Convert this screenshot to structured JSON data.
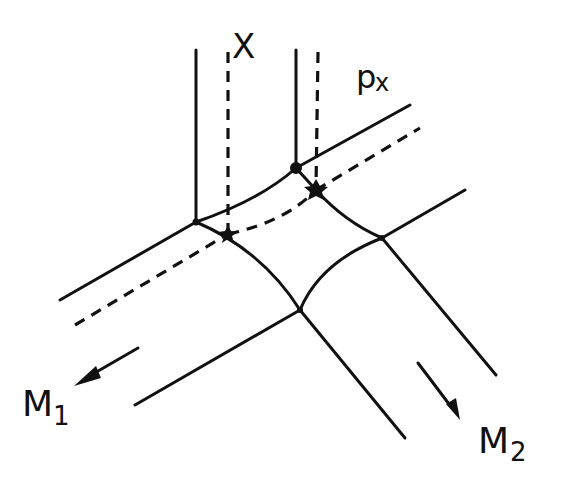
{
  "diagram": {
    "labels": {
      "top": "X",
      "top_right": "p",
      "top_right_sub": "x",
      "bottom_left": "M",
      "bottom_left_sub": "1",
      "bottom_right": "M",
      "bottom_right_sub": "2"
    },
    "colors": {
      "stroke": "#111111",
      "background": "#ffffff"
    },
    "elements": {
      "solid_lines": "boundary lines of the junction",
      "dashed_lines": "dashed trajectory of p_x through the junction",
      "vertex_dots": 2,
      "vertex_stars": 2,
      "arrows": 2
    }
  }
}
